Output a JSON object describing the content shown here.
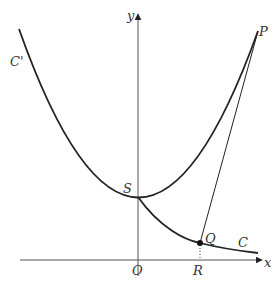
{
  "diagram": {
    "type": "coordinate-geometry",
    "axes": {
      "x_label": "x",
      "y_label": "y",
      "origin_label": "O"
    },
    "curves": [
      {
        "name": "C'",
        "label": "C'",
        "description": "parabola-shaped curve with vertex at S on the y-axis"
      },
      {
        "name": "C",
        "label": "C",
        "description": "decreasing curve starting at S and approaching the x-axis"
      }
    ],
    "points": {
      "S": "S",
      "P": "P",
      "Q": "Q",
      "R": "R",
      "O": "O"
    },
    "segments": [
      {
        "from": "Q",
        "to": "P",
        "style": "solid"
      },
      {
        "from": "Q",
        "to": "R",
        "style": "dotted"
      }
    ],
    "colors": {
      "stroke": "#222222",
      "axis": "#555555",
      "label": "#333333"
    }
  }
}
